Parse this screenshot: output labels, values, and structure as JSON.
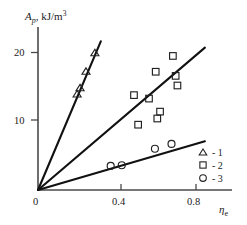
{
  "chart_data": {
    "type": "scatter",
    "title": "",
    "xlabel": "ηe",
    "ylabel": "Ap, kJ/m3",
    "xlim": [
      0,
      0.92
    ],
    "ylim": [
      0,
      22.5
    ],
    "grid": false,
    "xticks": [
      0,
      0.4,
      0.8
    ],
    "xtick_labels": [
      "0",
      "0.4",
      "0.8"
    ],
    "yticks": [
      10,
      20
    ],
    "ytick_labels": [
      "10",
      "20"
    ],
    "legend_position": "lower-right",
    "series": [
      {
        "name": "1",
        "marker": "triangle",
        "legend_label": "- 1",
        "points": [
          {
            "x": 0.198,
            "y": 14.0
          },
          {
            "x": 0.213,
            "y": 14.9
          },
          {
            "x": 0.243,
            "y": 17.3
          },
          {
            "x": 0.288,
            "y": 20.0
          }
        ],
        "trend_line": {
          "slope": 68.0,
          "intercept": 0,
          "x_start": 0.0,
          "x_end": 0.318
        }
      },
      {
        "name": "2",
        "marker": "square",
        "legend_label": "- 2",
        "points": [
          {
            "x": 0.486,
            "y": 13.8
          },
          {
            "x": 0.507,
            "y": 9.5
          },
          {
            "x": 0.562,
            "y": 13.3
          },
          {
            "x": 0.596,
            "y": 17.2
          },
          {
            "x": 0.604,
            "y": 10.4
          },
          {
            "x": 0.618,
            "y": 11.4
          },
          {
            "x": 0.683,
            "y": 19.5
          },
          {
            "x": 0.697,
            "y": 16.6
          },
          {
            "x": 0.706,
            "y": 15.2
          }
        ],
        "trend_line": {
          "slope": 24.5,
          "intercept": 0,
          "x_start": 0.0,
          "x_end": 0.845
        }
      },
      {
        "name": "3",
        "marker": "circle",
        "legend_label": "- 3",
        "points": [
          {
            "x": 0.368,
            "y": 3.5
          },
          {
            "x": 0.424,
            "y": 3.6
          },
          {
            "x": 0.592,
            "y": 6.0
          },
          {
            "x": 0.676,
            "y": 6.7
          }
        ],
        "trend_line": {
          "slope": 8.4,
          "intercept": 0,
          "x_start": 0.0,
          "x_end": 0.845
        }
      }
    ]
  },
  "axis": {
    "y_label_main": "A",
    "y_label_sub": "p",
    "y_label_rest": ", kJ/m",
    "y_label_sup": "3",
    "x_label_main": "η",
    "x_label_sub": "e"
  },
  "legend": {
    "entries": [
      {
        "marker": "triangle",
        "label": "- 1"
      },
      {
        "marker": "square",
        "label": "- 2"
      },
      {
        "marker": "circle",
        "label": "- 3"
      }
    ]
  }
}
